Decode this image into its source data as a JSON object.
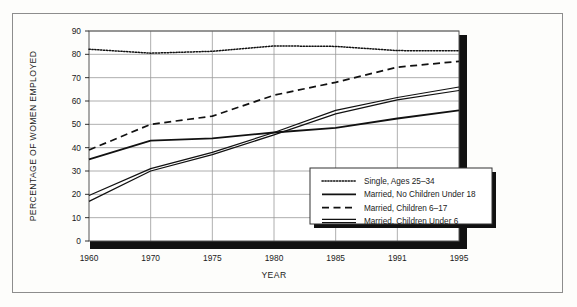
{
  "figure": {
    "background_color": "#fdfdfb",
    "frame_color": "#8d8d8d",
    "ink_color": "#1a1a1a",
    "grid_color": "#9a9a9a"
  },
  "chart_data": {
    "type": "line",
    "title": "",
    "xlabel": "YEAR",
    "ylabel": "PERCENTAGE OF WOMEN EMPLOYED",
    "categories": [
      "1960",
      "1970",
      "1975",
      "1980",
      "1985",
      "1991",
      "1995"
    ],
    "x_tick_labels": [
      "1960",
      "1970",
      "1975",
      "1980",
      "1985",
      "1991",
      "1995"
    ],
    "y_tick_labels": [
      "0",
      "10",
      "20",
      "30",
      "40",
      "50",
      "60",
      "70",
      "80",
      "90"
    ],
    "y_ticks": [
      0,
      10,
      20,
      30,
      40,
      50,
      60,
      70,
      80,
      90
    ],
    "ylim": [
      0,
      90
    ],
    "grid": "horizontal-and-vertical",
    "legend_position": "lower-right-inside",
    "series": [
      {
        "name": "Single, Ages 25-34",
        "style": "dotted",
        "values": [
          82.2,
          80.5,
          81.3,
          83.6,
          83.4,
          81.6,
          81.5
        ]
      },
      {
        "name": "Married, No Children Under 18",
        "style": "solid",
        "values": [
          35.0,
          43.0,
          44.0,
          46.5,
          48.5,
          52.5,
          56.0
        ]
      },
      {
        "name": "Married, Children 6-17",
        "style": "dashed",
        "values": [
          39.0,
          50.0,
          53.5,
          62.5,
          68.0,
          74.5,
          77.0
        ]
      },
      {
        "name": "Married, Children Under 6",
        "style": "double-solid",
        "values_upper": [
          19.5,
          31.0,
          38.0,
          46.5,
          56.0,
          61.5,
          66.0
        ],
        "values_lower": [
          17.0,
          30.0,
          37.0,
          45.5,
          54.5,
          60.5,
          64.5
        ]
      }
    ]
  },
  "legend": {
    "entries": [
      {
        "label": "Single, Ages 25–34",
        "swatch": "dotted"
      },
      {
        "label": "Married, No Children Under 18",
        "swatch": "solid"
      },
      {
        "label": "Married, Children 6–17",
        "swatch": "dashed"
      },
      {
        "label": "Married, Children Under 6",
        "swatch": "double-solid"
      }
    ]
  }
}
